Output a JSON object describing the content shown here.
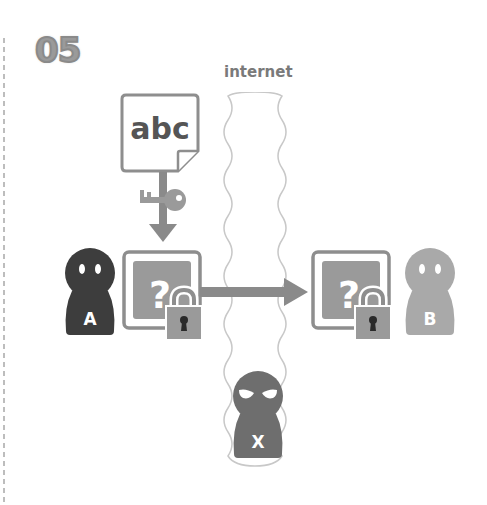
{
  "diagram": {
    "step_number": "05",
    "internet_label": "internet",
    "document_text": "abc",
    "sender_label": "A",
    "receiver_label": "B",
    "attacker_label": "X",
    "encrypted_symbol": "?",
    "colors": {
      "dark_person": "#3d3d3d",
      "light_person": "#a9a9a9",
      "attacker": "#6e6e6e",
      "box_fill": "#8e8e8e",
      "box_border": "#8e8e8e",
      "arrow": "#8a8a8a",
      "lock": "#959595",
      "internet_border": "#c4c4c4",
      "dashed_line": "#a0a0a0"
    }
  }
}
